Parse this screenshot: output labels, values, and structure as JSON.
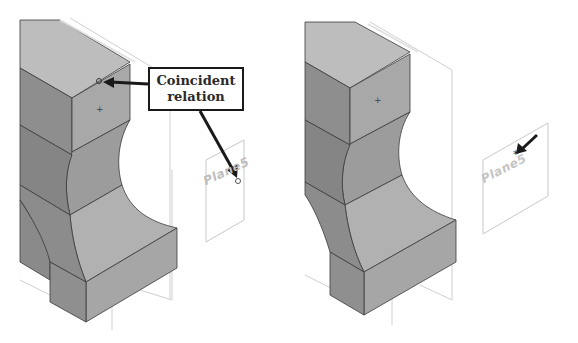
{
  "figure": {
    "left_view": {
      "callout_line1": "Coincident",
      "callout_line2": "relation",
      "plane_label": "Plane5"
    },
    "right_view": {
      "plane_label": "Plane5"
    }
  },
  "colors": {
    "top_face": "#bdbdbd",
    "front_face": "#a8a8a8",
    "side_face": "#8e8e8e",
    "edge": "#3a3a3a",
    "plane_outline": "#c8c8c8",
    "arrow": "#1a1a1a"
  }
}
